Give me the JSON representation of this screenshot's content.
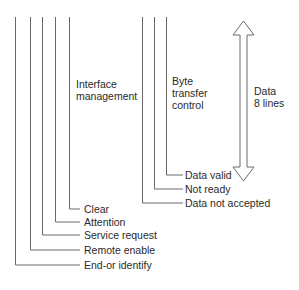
{
  "diagram": {
    "groups": {
      "interface_management": "Interface management",
      "interface_management_l1": "Interface",
      "interface_management_l2": "management",
      "byte_transfer_l1": "Byte",
      "byte_transfer_l2": "transfer",
      "byte_transfer_l3": "control",
      "data_l1": "Data",
      "data_l2": "8 lines"
    },
    "interface_lines": [
      "Clear",
      "Attention",
      "Service request",
      "Remote enable",
      "End-or identify"
    ],
    "handshake_lines": [
      "Data valid",
      "Not ready",
      "Data not accepted"
    ],
    "line_color": "#6a6a6a"
  }
}
